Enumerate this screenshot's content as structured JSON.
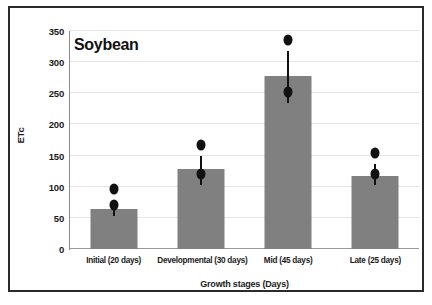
{
  "chart_data": {
    "type": "bar",
    "title": "Soybean",
    "xlabel": "Growth stages (Days)",
    "ylabel": "ETc",
    "categories": [
      "Initial (20 days)",
      "Developmental (30 days)",
      "Mid (45 days)",
      "Late (25 days)"
    ],
    "values": [
      65,
      128,
      278,
      118
    ],
    "error_low": [
      53,
      102,
      235,
      103
    ],
    "error_high": [
      79,
      150,
      318,
      137
    ],
    "ylim": [
      0,
      350
    ],
    "ytick_labels": [
      "0",
      "50",
      "100",
      "150",
      "200",
      "250",
      "300",
      "350"
    ],
    "ytick_values": [
      0,
      50,
      100,
      150,
      200,
      250,
      300,
      350
    ],
    "grid": true,
    "legend": "none",
    "bar_color": "#808080",
    "error_color": "#111111",
    "grid_color": "#e4e4e4",
    "axis_color": "#8d8d8d",
    "frame_color": "#2b2b2b",
    "background": "#ffffff"
  }
}
